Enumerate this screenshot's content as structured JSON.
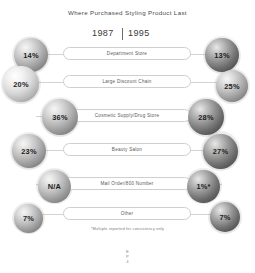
{
  "chart": {
    "title": "Where Purchased Styling Product Last",
    "footnote": "*Multiple reported for consistency only",
    "page_marker_line1": "E",
    "page_marker_line2": "P",
    "page_marker_line3": "4"
  },
  "years": {
    "left": "1987",
    "right": "1995"
  },
  "chart_data": {
    "type": "bar",
    "title": "Where Purchased Styling Product Last",
    "xlabel": "",
    "ylabel": "",
    "categories": [
      "Department Store",
      "Large Discount Chain",
      "Cosmetic Supply/Drug Store",
      "Beauty Salon",
      "Mail Order/800 Number",
      "Other"
    ],
    "series": [
      {
        "name": "1987",
        "values": [
          "14%",
          "20%",
          "36%",
          "23%",
          "N/A",
          "7%"
        ]
      },
      {
        "name": "1995",
        "values": [
          "13%",
          "25%",
          "28%",
          "27%",
          "1%*",
          "7%"
        ]
      }
    ],
    "legend_position": "top",
    "grid": false
  },
  "rows": [
    {
      "label": "Department Store",
      "left_value": "14%",
      "right_value": "13%",
      "left": {
        "size": 34,
        "x": 14,
        "y": 0,
        "tone": "mid"
      },
      "right": {
        "size": 34,
        "x": 205,
        "y": 0,
        "tone": "dark"
      }
    },
    {
      "label": "Large Discount Chain",
      "left_value": "20%",
      "right_value": "25%",
      "left": {
        "size": 36,
        "x": 3,
        "y": 1,
        "tone": "light"
      },
      "right": {
        "size": 32,
        "x": 216,
        "y": 3,
        "tone": "mid"
      }
    },
    {
      "label": "Cosmetic Supply/Drug Store",
      "left_value": "36%",
      "right_value": "28%",
      "left": {
        "size": 36,
        "x": 42,
        "y": 0,
        "tone": "mid"
      },
      "right": {
        "size": 36,
        "x": 188,
        "y": 0,
        "tone": "dark"
      }
    },
    {
      "label": "Beauty Salon",
      "left_value": "23%",
      "right_value": "27%",
      "left": {
        "size": 34,
        "x": 12,
        "y": 0,
        "tone": "mid"
      },
      "right": {
        "size": 35,
        "x": 203,
        "y": 0,
        "tone": "dark"
      }
    },
    {
      "label": "Mail Order/800 Number",
      "left_value": "N/A",
      "right_value": "1%*",
      "left": {
        "size": 33,
        "x": 38,
        "y": 1,
        "tone": "mid"
      },
      "right": {
        "size": 33,
        "x": 187,
        "y": 1,
        "tone": "dark"
      }
    },
    {
      "label": "Other",
      "left_value": "7%",
      "right_value": "7%",
      "left": {
        "size": 29,
        "x": 14,
        "y": 3,
        "tone": "mid"
      },
      "right": {
        "size": 30,
        "x": 210,
        "y": 2,
        "tone": "dark"
      }
    }
  ],
  "row_tops": [
    38,
    66,
    100,
    134,
    168,
    198
  ]
}
